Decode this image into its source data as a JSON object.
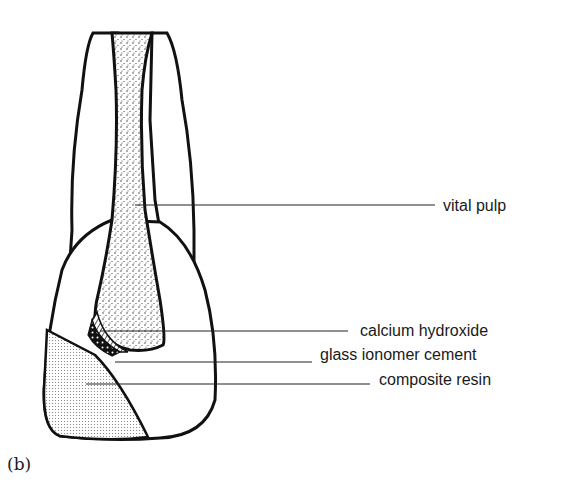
{
  "figure": {
    "panel_label": "(b)",
    "labels": [
      {
        "id": "vital_pulp",
        "text": "vital pulp"
      },
      {
        "id": "calcium_hydroxide",
        "text": "calcium hydroxide"
      },
      {
        "id": "glass_ionomer_cement",
        "text": "glass ionomer cement"
      },
      {
        "id": "composite_resin",
        "text": "composite resin"
      }
    ]
  }
}
